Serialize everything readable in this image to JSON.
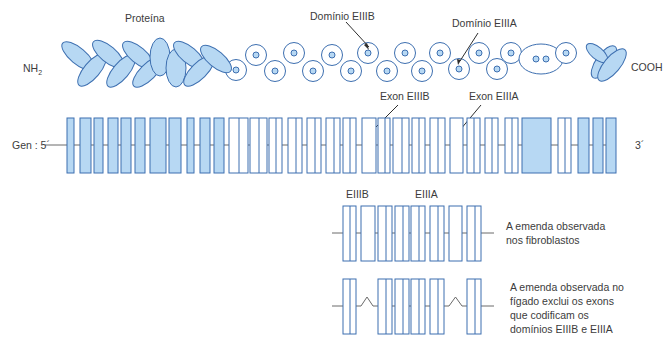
{
  "labels": {
    "protein": "Proteína",
    "nh2_main": "NH",
    "nh2_sub": "2",
    "cooh": "COOH",
    "domain_eiiib": "Domínio EIIIB",
    "domain_eiiia": "Domínio EIIIA",
    "exon_eiiib": "Exon EIIIB",
    "exon_eiiia": "Exon EIIIA",
    "gene_5": "Gen : 5´",
    "gene_3": "3´",
    "splice_eiiib": "EIIIB",
    "splice_eiiia": "EIIIA"
  },
  "captions": {
    "fibroblast": [
      "A emenda observada",
      "nos fibroblastos"
    ],
    "liver": [
      "A emenda observada no",
      "fígado exclui os exons",
      "que codificam os",
      "domínios EIIIB e EIIIA"
    ]
  },
  "colors": {
    "stroke": "#3d6fb0",
    "fill": "#b7d8f3",
    "line": "#6a6a6a",
    "text": "#3c3c3c",
    "arrow": "#2d2d2d"
  },
  "protein": {
    "ellipses": [
      {
        "cx": 78,
        "cy": 56,
        "rx": 8,
        "ry": 20,
        "rot": -50
      },
      {
        "cx": 92,
        "cy": 70,
        "rx": 8,
        "ry": 20,
        "rot": 40
      },
      {
        "cx": 108,
        "cy": 54,
        "rx": 8,
        "ry": 19,
        "rot": -50
      },
      {
        "cx": 121,
        "cy": 71,
        "rx": 8,
        "ry": 20,
        "rot": 40
      },
      {
        "cx": 138,
        "cy": 55,
        "rx": 8,
        "ry": 19,
        "rot": -50
      },
      {
        "cx": 148,
        "cy": 72,
        "rx": 8,
        "ry": 20,
        "rot": 45
      },
      {
        "cx": 160,
        "cy": 57,
        "rx": 10,
        "ry": 19,
        "rot": 0
      },
      {
        "cx": 176,
        "cy": 68,
        "rx": 10,
        "ry": 19,
        "rot": 0
      },
      {
        "cx": 189,
        "cy": 55,
        "rx": 8,
        "ry": 19,
        "rot": -50
      },
      {
        "cx": 199,
        "cy": 71,
        "rx": 8,
        "ry": 20,
        "rot": 45
      },
      {
        "cx": 216,
        "cy": 59,
        "rx": 8,
        "ry": 19,
        "rot": -50
      },
      {
        "cx": 604,
        "cy": 62,
        "rx": 8,
        "ry": 19,
        "rot": 35
      },
      {
        "cx": 597,
        "cy": 53,
        "rx": 6,
        "ry": 13,
        "rot": -50
      },
      {
        "cx": 612,
        "cy": 65,
        "rx": 8,
        "ry": 20,
        "rot": 40
      }
    ],
    "circles": [
      {
        "cx": 236,
        "cy": 70
      },
      {
        "cx": 256,
        "cy": 55
      },
      {
        "cx": 275,
        "cy": 71
      },
      {
        "cx": 294,
        "cy": 53
      },
      {
        "cx": 313,
        "cy": 71
      },
      {
        "cx": 332,
        "cy": 55
      },
      {
        "cx": 351,
        "cy": 71
      },
      {
        "cx": 368,
        "cy": 53
      },
      {
        "cx": 387,
        "cy": 71
      },
      {
        "cx": 405,
        "cy": 53
      },
      {
        "cx": 422,
        "cy": 71
      },
      {
        "cx": 440,
        "cy": 53
      },
      {
        "cx": 459,
        "cy": 69
      },
      {
        "cx": 479,
        "cy": 53
      },
      {
        "cx": 497,
        "cy": 69
      },
      {
        "cx": 511,
        "cy": 53
      }
    ],
    "double_oval": {
      "cx": 541,
      "cy": 59,
      "rx": 22,
      "ry": 15
    },
    "last_circle": {
      "cx": 566,
      "cy": 53
    }
  },
  "gene": {
    "y_top": 118,
    "y_bot": 173,
    "y_mid": 145,
    "line_start": 45,
    "line_end": 615,
    "exons": [
      {
        "x": 67,
        "w": 7,
        "f": 1
      },
      {
        "x": 80,
        "w": 11,
        "f": 1
      },
      {
        "x": 94,
        "w": 9,
        "f": 1
      },
      {
        "x": 108,
        "w": 10,
        "f": 1
      },
      {
        "x": 121,
        "w": 10,
        "f": 1
      },
      {
        "x": 135,
        "w": 10,
        "f": 1
      },
      {
        "x": 150,
        "w": 16,
        "f": 1
      },
      {
        "x": 169,
        "w": 12,
        "f": 1
      },
      {
        "x": 187,
        "w": 7,
        "f": 1
      },
      {
        "x": 200,
        "w": 10,
        "f": 1
      },
      {
        "x": 214,
        "w": 10,
        "f": 1
      },
      {
        "x": 229,
        "w": 19,
        "f": 0,
        "div": 1
      },
      {
        "x": 250,
        "w": 17,
        "f": 0,
        "div": 1
      },
      {
        "x": 269,
        "w": 13,
        "f": 0,
        "div": 1
      },
      {
        "x": 288,
        "w": 14,
        "f": 0,
        "div": 1
      },
      {
        "x": 307,
        "w": 14,
        "f": 0,
        "div": 1
      },
      {
        "x": 326,
        "w": 14,
        "f": 0,
        "div": 1
      },
      {
        "x": 343,
        "w": 13,
        "f": 0,
        "div": 1
      },
      {
        "x": 362,
        "w": 14,
        "f": 0
      },
      {
        "x": 378,
        "w": 12,
        "f": 0,
        "div": 1
      },
      {
        "x": 393,
        "w": 16,
        "f": 0,
        "div": 1
      },
      {
        "x": 412,
        "w": 13,
        "f": 0,
        "div": 1
      },
      {
        "x": 430,
        "w": 15,
        "f": 0,
        "div": 1
      },
      {
        "x": 450,
        "w": 13,
        "f": 0
      },
      {
        "x": 467,
        "w": 13,
        "f": 0,
        "div": 1
      },
      {
        "x": 485,
        "w": 13,
        "f": 0,
        "div": 1
      },
      {
        "x": 505,
        "w": 13,
        "f": 0,
        "div": 1
      },
      {
        "x": 522,
        "w": 29,
        "f": 1
      },
      {
        "x": 558,
        "w": 13,
        "f": 0,
        "div": 1
      },
      {
        "x": 578,
        "w": 11,
        "f": 1
      },
      {
        "x": 593,
        "w": 10,
        "f": 1
      },
      {
        "x": 606,
        "w": 10,
        "f": 1
      }
    ]
  },
  "splice_fibro": {
    "y_top": 206,
    "y_bot": 261,
    "y_mid": 233,
    "line_start": 332,
    "line_end": 494,
    "exons": [
      {
        "x": 343,
        "w": 13,
        "div": 1
      },
      {
        "x": 361,
        "w": 14,
        "div": 0
      },
      {
        "x": 378,
        "w": 14,
        "div": 1
      },
      {
        "x": 395,
        "w": 14,
        "div": 1
      },
      {
        "x": 411,
        "w": 14,
        "div": 1
      },
      {
        "x": 430,
        "w": 14,
        "div": 1
      },
      {
        "x": 449,
        "w": 13,
        "div": 0
      },
      {
        "x": 467,
        "w": 14,
        "div": 1
      }
    ]
  },
  "splice_liver": {
    "y_top": 279,
    "y_bot": 334,
    "y_mid": 306,
    "line_start": 332,
    "line_end": 494,
    "exons": [
      {
        "x": 343,
        "w": 13,
        "div": 1
      },
      {
        "x": 378,
        "w": 14,
        "div": 1
      },
      {
        "x": 395,
        "w": 14,
        "div": 1
      },
      {
        "x": 411,
        "w": 14,
        "div": 1
      },
      {
        "x": 430,
        "w": 14,
        "div": 1
      },
      {
        "x": 467,
        "w": 14,
        "div": 1
      }
    ],
    "skips": [
      {
        "x1": 356,
        "x2": 378
      },
      {
        "x1": 444,
        "x2": 467
      }
    ]
  }
}
